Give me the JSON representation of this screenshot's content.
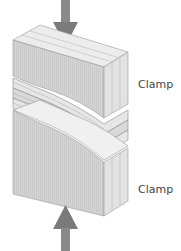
{
  "diagram": {
    "labels": {
      "top_clamp": "Clamp",
      "bottom_clamp": "Clamp"
    },
    "arrows": [
      {
        "name": "top-force-arrow",
        "direction": "down"
      },
      {
        "name": "bottom-force-arrow",
        "direction": "up"
      }
    ],
    "colors": {
      "arrow": "#7a7a7a",
      "clamp_face": "#d2d2d2",
      "clamp_top": "#e8e8e8",
      "clamp_side": "#dcdcdc",
      "laminate": "#e0e0e0",
      "outline": "#8a8a8a"
    }
  }
}
